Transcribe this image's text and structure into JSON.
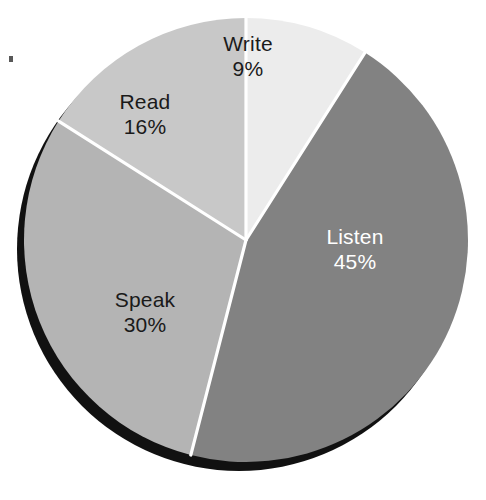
{
  "background_color": "#ffffff",
  "chart_data": {
    "type": "pie",
    "title": "",
    "subtitle": "",
    "xlabel": "",
    "ylabel": "",
    "legend_position": "none",
    "grid": false,
    "labels_inside_slices": true,
    "start_angle_deg": 0,
    "direction": "clockwise",
    "categories": [
      "Write",
      "Listen",
      "Speak",
      "Read"
    ],
    "values": [
      9,
      45,
      30,
      16
    ],
    "value_suffix": "%",
    "total": 100,
    "slices": [
      {
        "name": "Write",
        "value": 9,
        "value_label": "9%",
        "color": "#ececec",
        "label_color": "#1a1a1a",
        "sweep_deg": 32.4,
        "start_deg": 0,
        "end_deg": 32.4
      },
      {
        "name": "Listen",
        "value": 45,
        "value_label": "45%",
        "color": "#828282",
        "label_color": "#ffffff",
        "sweep_deg": 162,
        "start_deg": 32.4,
        "end_deg": 194.4
      },
      {
        "name": "Speak",
        "value": 30,
        "value_label": "30%",
        "color": "#b4b4b4",
        "label_color": "#1a1a1a",
        "sweep_deg": 108,
        "start_deg": 194.4,
        "end_deg": 302.4
      },
      {
        "name": "Read",
        "value": 16,
        "value_label": "16%",
        "color": "#c8c8c8",
        "label_color": "#1a1a1a",
        "sweep_deg": 57.6,
        "start_deg": 302.4,
        "end_deg": 360
      }
    ],
    "separator_color": "#ffffff",
    "shadow_color": "#111111"
  }
}
